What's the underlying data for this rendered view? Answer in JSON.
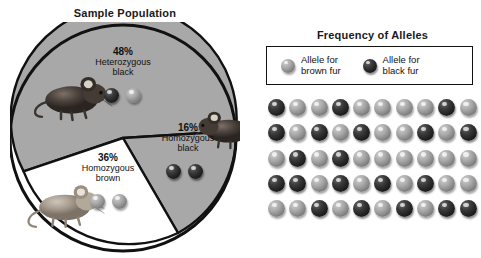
{
  "pie_panel": {
    "title": "Sample Population",
    "segments": [
      {
        "pct": "48%",
        "name_line1": "Heterozygous",
        "name_line2": "black",
        "value": 48,
        "fill": "#a8a8a8",
        "alleles": [
          "black",
          "brown"
        ]
      },
      {
        "pct": "16%",
        "name_line1": "Homozygous",
        "name_line2": "black",
        "value": 16,
        "fill": "#a8a8a8",
        "alleles": [
          "black",
          "black"
        ]
      },
      {
        "pct": "36%",
        "name_line1": "Homozygous",
        "name_line2": "brown",
        "value": 36,
        "fill": "#ffffff",
        "alleles": [
          "brown",
          "brown"
        ]
      }
    ]
  },
  "freq_panel": {
    "title": "Frequency of Alleles",
    "legend": [
      {
        "marble": "brown",
        "line1": "Allele for",
        "line2": "brown fur"
      },
      {
        "marble": "black",
        "line1": "Allele for",
        "line2": "black fur"
      }
    ]
  },
  "chart_data": {
    "type": "pie",
    "title": "Sample Population",
    "categories": [
      "Heterozygous black",
      "Homozygous black",
      "Homozygous brown"
    ],
    "values": [
      48,
      16,
      36
    ],
    "labels": [
      "48%",
      "16%",
      "36%"
    ],
    "colors": [
      "#a8a8a8",
      "#a8a8a8",
      "#ffffff"
    ],
    "xlabel": "",
    "ylabel": "",
    "legend_position": "inside-slices",
    "grid": false,
    "secondary": {
      "type": "grid",
      "title": "Frequency of Alleles",
      "rows": 5,
      "columns": 10,
      "total_alleles": 50,
      "legend": [
        "Allele for brown fur",
        "Allele for black fur"
      ],
      "counts": {
        "brown": 30,
        "black": 20
      },
      "frequencies": {
        "brown": 0.6,
        "black": 0.4
      },
      "cells": [
        [
          "black",
          "brown",
          "brown",
          "black",
          "brown",
          "brown",
          "brown",
          "brown",
          "black",
          "brown"
        ],
        [
          "black",
          "brown",
          "black",
          "brown",
          "black",
          "brown",
          "brown",
          "black",
          "brown",
          "black"
        ],
        [
          "brown",
          "black",
          "brown",
          "black",
          "brown",
          "brown",
          "brown",
          "brown",
          "brown",
          "brown"
        ],
        [
          "black",
          "black",
          "brown",
          "black",
          "brown",
          "black",
          "brown",
          "black",
          "brown",
          "brown"
        ],
        [
          "brown",
          "brown",
          "black",
          "brown",
          "black",
          "brown",
          "black",
          "brown",
          "black",
          "black"
        ]
      ]
    }
  }
}
